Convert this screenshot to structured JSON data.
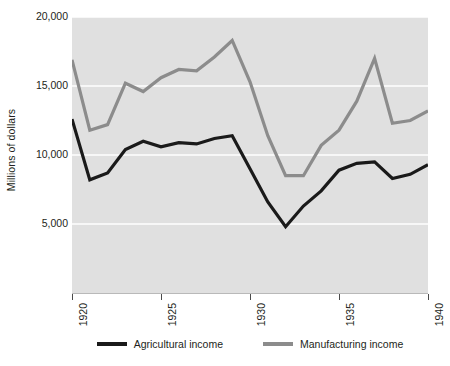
{
  "chart_data": {
    "type": "line",
    "title": "",
    "subtitle": "",
    "xlabel": "",
    "ylabel": "Millions of dollars",
    "xlim": [
      1920,
      1940
    ],
    "ylim": [
      0,
      20000
    ],
    "grid": true,
    "grid_axis": "y",
    "legend_position": "bottom",
    "plot_background": "#e0e0e0",
    "x": [
      1920,
      1921,
      1922,
      1923,
      1924,
      1925,
      1926,
      1927,
      1928,
      1929,
      1930,
      1931,
      1932,
      1933,
      1934,
      1935,
      1936,
      1937,
      1938,
      1939,
      1940
    ],
    "x_tick_values": [
      1920,
      1925,
      1930,
      1935,
      1940
    ],
    "x_tick_labels": [
      "1920",
      "1925",
      "1930",
      "1935",
      "1940"
    ],
    "y_tick_values": [
      5000,
      10000,
      15000,
      20000
    ],
    "y_tick_labels": [
      "5,000",
      "10,000",
      "15,000",
      "20,000"
    ],
    "series": [
      {
        "name": "Agricultural income",
        "color": "#1a1a1a",
        "line_width": 3.2,
        "values": [
          12600,
          8200,
          8700,
          10400,
          11000,
          10600,
          10900,
          10800,
          11200,
          11400,
          9000,
          6600,
          4800,
          6300,
          7400,
          8900,
          9400,
          9500,
          8300,
          8600,
          9300
        ]
      },
      {
        "name": "Manufacturing income",
        "color": "#8c8c8c",
        "line_width": 3.2,
        "values": [
          16900,
          11800,
          12200,
          15200,
          14600,
          15600,
          16200,
          16100,
          17100,
          18300,
          15300,
          11400,
          8500,
          8500,
          10700,
          11800,
          13900,
          17000,
          12300,
          12500,
          13200
        ]
      }
    ],
    "annotations": []
  },
  "axis": {
    "y_title": "Millions of dollars"
  },
  "legend": {
    "items": [
      {
        "label": "Agricultural income",
        "color": "#1a1a1a",
        "swatch_name": "legend-swatch-agricultural"
      },
      {
        "label": "Manufacturing income",
        "color": "#8c8c8c",
        "swatch_name": "legend-swatch-manufacturing"
      }
    ]
  }
}
